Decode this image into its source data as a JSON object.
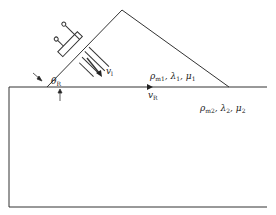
{
  "diagram": {
    "type": "wedge-transducer-rayleigh-wave",
    "stroke_color": "#333333",
    "labels": {
      "wave_velocity": {
        "symbol": "v",
        "sub": "l"
      },
      "angle": {
        "symbol": "θ",
        "sub": "R"
      },
      "rayleigh_velocity": {
        "symbol": "v",
        "sub": "R"
      },
      "medium1": {
        "rho": "ρ",
        "rho_sub": "m1",
        "lambda": "λ",
        "lambda_sub": "1",
        "mu": "μ",
        "mu_sub": "1",
        "sep": ", "
      },
      "medium2": {
        "rho": "ρ",
        "rho_sub": "m2",
        "lambda": "λ",
        "lambda_sub": "2",
        "mu": "μ",
        "mu_sub": "2",
        "sep": ", "
      }
    },
    "components": [
      "wedge-prism",
      "transducer",
      "wavefronts",
      "propagation-arrow",
      "substrate",
      "surface-wave-arrow",
      "angle-marker"
    ]
  }
}
